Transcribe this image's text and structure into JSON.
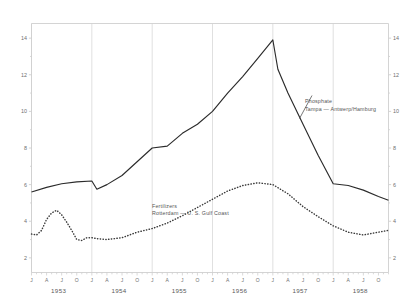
{
  "chart_data": {
    "type": "line",
    "title": "",
    "xlabel": "",
    "ylabel": "",
    "ylim": [
      1.2,
      14.8
    ],
    "y_ticks": [
      2,
      4,
      6,
      8,
      10,
      12,
      14
    ],
    "y_tick_labels": [
      "2",
      "4",
      "6",
      "8",
      "10",
      "12",
      "14"
    ],
    "right_axis": true,
    "right_y_tick_labels": [
      "2",
      "4",
      "6",
      "8",
      "10",
      "12",
      "14"
    ],
    "grid": "vertical gridlines at each January",
    "legend_position": "inline annotations on plot",
    "x_month_labels": [
      "J",
      "A",
      "J",
      "O"
    ],
    "x_year_labels": [
      "1953",
      "1954",
      "1955",
      "1956",
      "1957",
      "1958"
    ],
    "x_range_start": "1953-01",
    "x_range_end": "1958-12",
    "series": [
      {
        "name": "Phosphate",
        "sublabel": "Tampa  —  Antwerp/Hamburg",
        "style": "solid",
        "color": "#2b2b2b",
        "x": [
          "1953-01",
          "1953-04",
          "1953-07",
          "1953-10",
          "1954-01",
          "1954-02",
          "1954-04",
          "1954-07",
          "1954-10",
          "1955-01",
          "1955-04",
          "1955-07",
          "1955-10",
          "1956-01",
          "1956-04",
          "1956-07",
          "1956-10",
          "1957-01",
          "1957-02",
          "1957-04",
          "1957-07",
          "1957-10",
          "1958-01",
          "1958-04",
          "1958-07",
          "1958-10",
          "1958-12"
        ],
        "values": [
          5.6,
          5.85,
          6.05,
          6.15,
          6.2,
          5.75,
          6.0,
          6.5,
          7.25,
          8.0,
          8.1,
          8.8,
          9.3,
          10.0,
          11.0,
          11.9,
          12.9,
          13.9,
          12.3,
          11.0,
          9.3,
          7.6,
          6.05,
          5.95,
          5.7,
          5.35,
          5.15
        ]
      },
      {
        "name": "Fertilizers",
        "sublabel": "Rotterdam  —  U. S. Gulf Coast",
        "style": "dotted",
        "color": "#3a3a3a",
        "x": [
          "1953-01",
          "1953-02",
          "1953-03",
          "1953-04",
          "1953-05",
          "1953-06",
          "1953-07",
          "1953-08",
          "1953-09",
          "1953-10",
          "1953-11",
          "1953-12",
          "1954-01",
          "1954-02",
          "1954-04",
          "1954-07",
          "1954-10",
          "1955-01",
          "1955-04",
          "1955-07",
          "1955-10",
          "1956-01",
          "1956-04",
          "1956-07",
          "1956-10",
          "1957-01",
          "1957-04",
          "1957-07",
          "1957-10",
          "1958-01",
          "1958-04",
          "1958-07",
          "1958-10",
          "1958-12"
        ],
        "values": [
          3.3,
          3.25,
          3.5,
          4.1,
          4.45,
          4.6,
          4.35,
          3.95,
          3.5,
          3.0,
          2.95,
          3.1,
          3.1,
          3.05,
          3.0,
          3.1,
          3.4,
          3.6,
          3.9,
          4.3,
          4.75,
          5.2,
          5.65,
          5.95,
          6.1,
          6.0,
          5.5,
          4.8,
          4.25,
          3.75,
          3.4,
          3.25,
          3.4,
          3.5
        ]
      }
    ],
    "annotations": [
      {
        "id": "phosphate-label",
        "line1": "Phosphate",
        "line2": "Tampa  —  Antwerp/Hamburg"
      },
      {
        "id": "fertilizers-label",
        "line1": "Fertilizers",
        "line2": "Rotterdam  —  U. S. Gulf Coast"
      }
    ]
  },
  "colors": {
    "frame": "#cfcfcf",
    "grid": "#d8d8d8",
    "solid_series": "#2b2b2b",
    "dotted_series": "#3a3a3a",
    "tick_text": "#6f6f6f",
    "year_text": "#595959",
    "background": "#ffffff"
  }
}
